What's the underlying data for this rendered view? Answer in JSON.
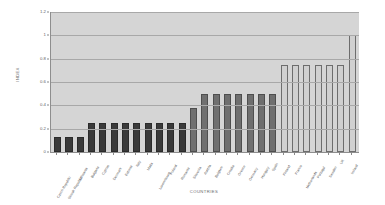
{
  "chart_data": {
    "type": "bar",
    "title": "",
    "xlabel": "COUNTRIES",
    "ylabel": "INDEX",
    "ylim": [
      0,
      1.2
    ],
    "yticks": [
      "0",
      "0.2",
      "0.4",
      "0.6",
      "0.8",
      "1",
      "1.2"
    ],
    "ytick_values": [
      0,
      0.2,
      0.4,
      0.6,
      0.8,
      1,
      1.2
    ],
    "grid": true,
    "legend": "none",
    "plot_background": "#d5d5d5",
    "group_colors": {
      "dark": "#3a3a3a",
      "mid": "#6f6f6f",
      "light": "#d0d0d0"
    },
    "categories": [
      "Czech Republic",
      "Slovak Republic",
      "Lithuania",
      "Bulgaria",
      "Cyprus",
      "Denmark",
      "Estonia",
      "Italy",
      "Malta",
      "Luxembourg",
      "Poland",
      "Romania",
      "Slovenia",
      "Austria",
      "Belgium",
      "Croatia",
      "Greece",
      "Germany",
      "Hungary",
      "Spain",
      "Finland",
      "France",
      "Netherlands",
      "Portugal",
      "Sweden",
      "UK",
      "Ireland"
    ],
    "values": [
      0.125,
      0.125,
      0.125,
      0.25,
      0.25,
      0.25,
      0.25,
      0.25,
      0.25,
      0.25,
      0.25,
      0.25,
      0.375,
      0.5,
      0.5,
      0.5,
      0.5,
      0.5,
      0.5,
      0.5,
      0.75,
      0.75,
      0.75,
      0.75,
      0.75,
      0.75,
      1.0
    ],
    "groups": [
      "dark",
      "dark",
      "dark",
      "dark",
      "dark",
      "dark",
      "dark",
      "dark",
      "dark",
      "dark",
      "dark",
      "dark",
      "mid",
      "mid",
      "mid",
      "mid",
      "mid",
      "mid",
      "mid",
      "mid",
      "light",
      "light",
      "light",
      "light",
      "light",
      "light",
      "light"
    ]
  }
}
